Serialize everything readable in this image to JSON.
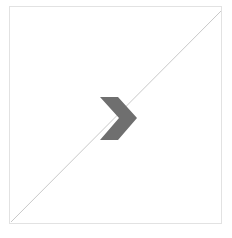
{
  "figure": {
    "title": "",
    "background_color": "#ffffff",
    "width": 232,
    "height": 238
  },
  "panel": {
    "name": "diagram-panel",
    "border_color": "#e2e2e2",
    "fill_color": "#ffffff",
    "x": 9,
    "y": 6,
    "width": 213,
    "height": 218
  },
  "shapes": {
    "diagonal_line": {
      "label": "diagonal-line",
      "color": "#c9c9c9",
      "stroke_width": 1,
      "from": [
        11,
        222
      ],
      "to": [
        221,
        11
      ]
    },
    "chevron": {
      "label": "chevron-right",
      "color": "#6f6f6f",
      "direction": "right",
      "x": 100,
      "y": 97,
      "width": 37,
      "height": 43,
      "points": "100,97 118,97 137,118 118,140 100,140 119,118"
    }
  },
  "legend": {
    "visible": false,
    "entries": []
  },
  "axes": {
    "visible": false,
    "xlabel": "",
    "ylabel": "",
    "ticks": []
  }
}
